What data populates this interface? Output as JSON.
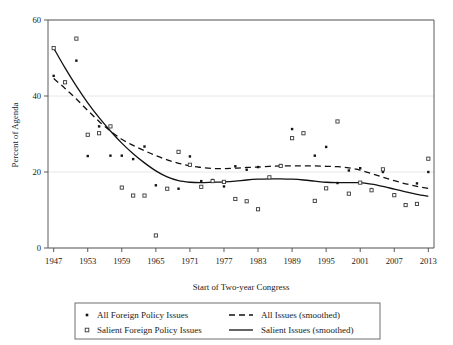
{
  "chart_data": {
    "type": "scatter",
    "title": "",
    "xlabel": "Start of Two-year Congress",
    "ylabel": "Percent of Agenda",
    "xlim": [
      1946,
      2014
    ],
    "ylim": [
      0,
      60
    ],
    "xticks": [
      1947,
      1953,
      1959,
      1965,
      1971,
      1977,
      1983,
      1989,
      1995,
      2001,
      2007,
      2013
    ],
    "yticks": [
      0,
      20,
      40,
      60
    ],
    "grid": "horizontal",
    "legend_position": "below-axis",
    "series": [
      {
        "name": "All Foreign Policy Issues",
        "marker": "filled-square",
        "x": [
          1947,
          1949,
          1951,
          1953,
          1955,
          1957,
          1959,
          1961,
          1963,
          1965,
          1967,
          1969,
          1971,
          1973,
          1975,
          1977,
          1979,
          1981,
          1983,
          1985,
          1987,
          1989,
          1991,
          1993,
          1995,
          1997,
          1999,
          2001,
          2003,
          2005,
          2007,
          2009,
          2011,
          2013
        ],
        "values": [
          45.3,
          43.8,
          49.3,
          24.2,
          32.0,
          24.3,
          24.3,
          23.4,
          26.7,
          16.5,
          15.7,
          15.6,
          24.1,
          17.6,
          17.9,
          16.2,
          21.5,
          20.6,
          21.3,
          18.6,
          21.8,
          31.3,
          30.2,
          24.3,
          26.6,
          17.1,
          20.4,
          21.0,
          15.5,
          20.0,
          14.1,
          11.3,
          17.0,
          20.0
        ]
      },
      {
        "name": "Salient Foreign Policy Issues",
        "marker": "open-square",
        "x": [
          1947,
          1949,
          1951,
          1953,
          1955,
          1957,
          1959,
          1961,
          1963,
          1965,
          1967,
          1969,
          1971,
          1973,
          1975,
          1977,
          1979,
          1981,
          1983,
          1985,
          1987,
          1989,
          1991,
          1993,
          1995,
          1997,
          1999,
          2001,
          2003,
          2005,
          2007,
          2009,
          2011,
          2013
        ],
        "values": [
          52.6,
          43.6,
          55.1,
          29.8,
          30.2,
          32.0,
          15.9,
          13.8,
          13.8,
          3.3,
          15.6,
          25.3,
          21.9,
          16.1,
          17.6,
          17.4,
          12.9,
          12.3,
          10.2,
          18.6,
          21.6,
          28.9,
          30.2,
          12.4,
          15.7,
          33.3,
          14.3,
          17.2,
          15.2,
          20.7,
          13.9,
          11.3,
          11.6,
          23.5
        ]
      }
    ],
    "smoothed": [
      {
        "name": "All Issues (smoothed)",
        "style": "dashed",
        "x": [
          1947,
          1949,
          1951,
          1953,
          1955,
          1957,
          1959,
          1961,
          1963,
          1965,
          1967,
          1969,
          1971,
          1973,
          1975,
          1977,
          1979,
          1981,
          1983,
          1985,
          1987,
          1989,
          1991,
          1993,
          1995,
          1997,
          1999,
          2001,
          2003,
          2005,
          2007,
          2009,
          2011,
          2013
        ],
        "values": [
          44.6,
          42.0,
          39.2,
          36.2,
          33.3,
          30.8,
          28.6,
          27.0,
          25.6,
          24.3,
          23.2,
          22.3,
          21.6,
          21.2,
          20.9,
          20.9,
          21.0,
          21.2,
          21.3,
          21.5,
          21.6,
          21.6,
          21.6,
          21.6,
          21.5,
          21.4,
          21.1,
          20.5,
          19.6,
          18.6,
          17.7,
          16.9,
          16.2,
          15.7
        ]
      },
      {
        "name": "Salient Issues (smoothed)",
        "style": "solid",
        "x": [
          1947,
          1949,
          1951,
          1953,
          1955,
          1957,
          1959,
          1961,
          1963,
          1965,
          1967,
          1969,
          1971,
          1973,
          1975,
          1977,
          1979,
          1981,
          1983,
          1985,
          1987,
          1989,
          1991,
          1993,
          1995,
          1997,
          1999,
          2001,
          2003,
          2005,
          2007,
          2009,
          2011,
          2013
        ],
        "values": [
          52.6,
          47.4,
          42.6,
          38.2,
          34.3,
          30.8,
          27.6,
          24.8,
          22.4,
          20.3,
          18.7,
          17.7,
          17.3,
          17.2,
          17.3,
          17.4,
          17.6,
          17.9,
          18.1,
          18.2,
          18.2,
          18.1,
          17.9,
          17.6,
          17.3,
          17.2,
          17.2,
          17.2,
          16.8,
          16.2,
          15.5,
          14.8,
          14.1,
          13.6
        ]
      }
    ]
  },
  "legend": {
    "entries": [
      {
        "label": "All Foreign Policy Issues",
        "marker": "filled-square"
      },
      {
        "label": "Salient Foreign Policy Issues",
        "marker": "open-square"
      },
      {
        "label": "All Issues (smoothed)",
        "marker": "dashed-line"
      },
      {
        "label": "Salient Issues (smoothed)",
        "marker": "solid-line"
      }
    ]
  }
}
